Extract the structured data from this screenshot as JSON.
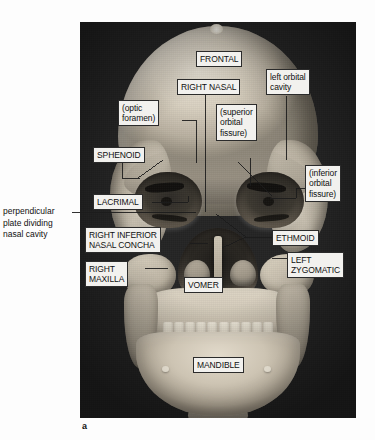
{
  "figure": {
    "panel_letter": "a",
    "outside_note": "perpendicular\nplate dividing\nnasal cavity",
    "photo_subject": "anterior-view-human-skull-photograph"
  },
  "labels": [
    {
      "id": "frontal",
      "text": "FRONTAL",
      "name": "label-frontal"
    },
    {
      "id": "right_nasal",
      "text": "RIGHT NASAL",
      "name": "label-right-nasal"
    },
    {
      "id": "left_orbital",
      "text": "left orbital\ncavity",
      "name": "label-left-orbital-cavity"
    },
    {
      "id": "optic_foramen",
      "text": "(optic\nforamen)",
      "name": "label-optic-foramen"
    },
    {
      "id": "superior_fissure",
      "text": "(superior\norbital\nfissure)",
      "name": "label-superior-orbital-fissure"
    },
    {
      "id": "inferior_fissure",
      "text": "(inferior\norbital\nfissure)",
      "name": "label-inferior-orbital-fissure"
    },
    {
      "id": "sphenoid",
      "text": "SPHENOID",
      "name": "label-sphenoid"
    },
    {
      "id": "lacrimal",
      "text": "LACRIMAL",
      "name": "label-lacrimal"
    },
    {
      "id": "right_concha",
      "text": "RIGHT INFERIOR\nNASAL CONCHA",
      "name": "label-right-inferior-nasal-concha"
    },
    {
      "id": "ethmoid",
      "text": "ETHMOID",
      "name": "label-ethmoid"
    },
    {
      "id": "right_maxilla",
      "text": "RIGHT\nMAXILLA",
      "name": "label-right-maxilla"
    },
    {
      "id": "vomer",
      "text": "VOMER",
      "name": "label-vomer"
    },
    {
      "id": "left_zygomatic",
      "text": "LEFT\nZYGOMATIC",
      "name": "label-left-zygomatic"
    },
    {
      "id": "mandible",
      "text": "MANDIBLE",
      "name": "label-mandible"
    }
  ],
  "colors": {
    "label_fill": "#f2f1ee",
    "label_border": "#2b2b2b",
    "photo_background": "#242424",
    "bone_light": "#e8e2d6",
    "bone_mid": "#c8c0b0",
    "bone_dark": "#8d8678",
    "page_background": "#fdfdfd"
  }
}
